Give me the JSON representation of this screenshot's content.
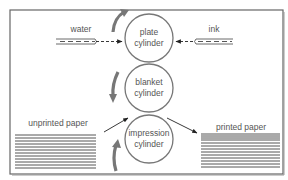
{
  "inputs": {
    "water": {
      "label": "water"
    },
    "ink": {
      "label": "ink"
    }
  },
  "cylinders": [
    {
      "id": "plate",
      "line1": "plate",
      "line2": "cylinder",
      "rotation": "clockwise"
    },
    {
      "id": "blanket",
      "line1": "blanket",
      "line2": "cylinder",
      "rotation": "counterclockwise"
    },
    {
      "id": "impression",
      "line1": "impression",
      "line2": "cylinder",
      "rotation": "clockwise"
    }
  ],
  "paper": {
    "input": {
      "label": "unprinted paper"
    },
    "output": {
      "label": "printed paper"
    }
  },
  "colors": {
    "border": "#666666",
    "cylinder_stroke": "#777777",
    "rotation_arrow": "#777777",
    "paper_lines": "#555555",
    "text": "#555555"
  }
}
